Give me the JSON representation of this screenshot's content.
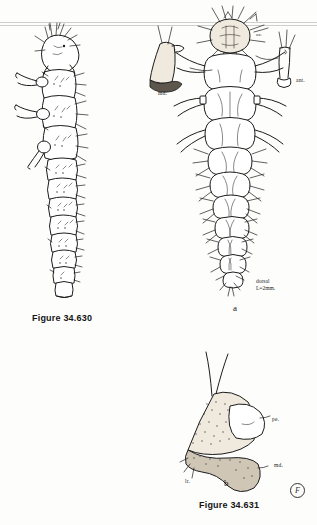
{
  "plate": {
    "background_color": "#fdfdfc",
    "ink_color": "#1c1c1c"
  },
  "figures": [
    {
      "id": "fig-34-630",
      "caption": "Figure 34.630",
      "view": "lateral larva",
      "annotations": []
    },
    {
      "id": "fig-34-631",
      "caption": "Figure 34.631",
      "parts": [
        {
          "key": "a",
          "label": "a",
          "view": "dorsal",
          "scale_line1": "dorsal",
          "scale_line2": "L=2mm.",
          "annotations": [
            {
              "name": "ocelli",
              "text": "oc."
            },
            {
              "name": "mandible",
              "text": "md."
            },
            {
              "name": "antenna",
              "text": "ant."
            }
          ]
        },
        {
          "key": "b",
          "label": "b",
          "view": "mouthparts detail",
          "annotations": [
            {
              "name": "pedipalp",
              "text": "pe."
            },
            {
              "name": "mandible",
              "text": "md."
            },
            {
              "name": "labrum",
              "text": "lr."
            }
          ]
        }
      ]
    }
  ],
  "signature": {
    "monogram": "F"
  }
}
